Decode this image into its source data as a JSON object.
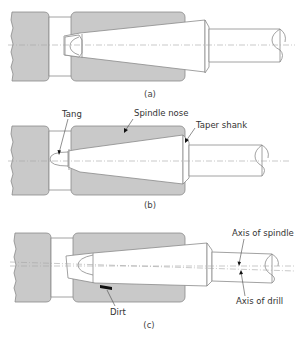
{
  "figure": {
    "panels": [
      {
        "id": "a",
        "caption": "(a)",
        "labels": []
      },
      {
        "id": "b",
        "caption": "(b)",
        "labels": [
          "Tang",
          "Spindle nose",
          "Taper shank"
        ]
      },
      {
        "id": "c",
        "caption": "(c)",
        "labels": [
          "Dirt",
          "Axis of spindle",
          "Axis of drill"
        ]
      }
    ]
  },
  "labels": {
    "tang": "Tang",
    "spindle_nose": "Spindle nose",
    "taper_shank": "Taper shank",
    "dirt": "Dirt",
    "axis_of_spindle": "Axis of spindle",
    "axis_of_drill": "Axis of drill"
  },
  "captions": {
    "a": "(a)",
    "b": "(b)",
    "c": "(c)"
  },
  "colors": {
    "fill_gray": "#c9c9c9",
    "outline": "#8a8a8a",
    "text": "#333333",
    "dirt": "#111111"
  }
}
